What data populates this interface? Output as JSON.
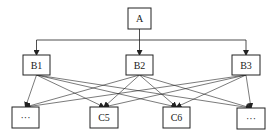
{
  "diagram": {
    "type": "hierarchy",
    "nodes": {
      "A": {
        "label": "A",
        "x": 128,
        "y": 8,
        "w": 23,
        "h": 21
      },
      "B1": {
        "label": "B1",
        "x": 23,
        "y": 55,
        "w": 27,
        "h": 20
      },
      "B2": {
        "label": "B2",
        "x": 126,
        "y": 55,
        "w": 27,
        "h": 20
      },
      "B3": {
        "label": "B3",
        "x": 232,
        "y": 55,
        "w": 28,
        "h": 20
      },
      "C1": {
        "label": "···",
        "x": 12,
        "y": 107,
        "w": 27,
        "h": 21
      },
      "C5": {
        "label": "C5",
        "x": 90,
        "y": 107,
        "w": 28,
        "h": 21
      },
      "C6": {
        "label": "C6",
        "x": 163,
        "y": 107,
        "w": 27,
        "h": 21
      },
      "C8": {
        "label": "···",
        "x": 237,
        "y": 108,
        "w": 28,
        "h": 21
      }
    },
    "edges_top": [
      "B1",
      "B2",
      "B3"
    ],
    "edges_bottom": [
      [
        "B1",
        "C1"
      ],
      [
        "B1",
        "C5"
      ],
      [
        "B1",
        "C6"
      ],
      [
        "B1",
        "C8"
      ],
      [
        "B2",
        "C1"
      ],
      [
        "B2",
        "C5"
      ],
      [
        "B2",
        "C6"
      ],
      [
        "B2",
        "C8"
      ],
      [
        "B3",
        "C1"
      ],
      [
        "B3",
        "C5"
      ],
      [
        "B3",
        "C6"
      ],
      [
        "B3",
        "C8"
      ]
    ]
  }
}
